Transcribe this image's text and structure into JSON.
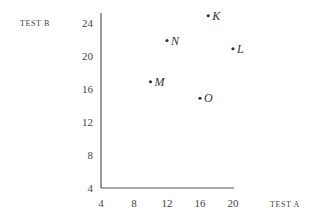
{
  "chart_data": {
    "type": "scatter",
    "title": "",
    "xlabel": "TEST A",
    "ylabel": "TEST B",
    "xlim": [
      4,
      20
    ],
    "ylim": [
      4,
      25
    ],
    "xticks": [
      4,
      8,
      12,
      16,
      20
    ],
    "yticks": [
      4,
      8,
      12,
      16,
      20,
      24
    ],
    "grid": false,
    "legend": null,
    "points": [
      {
        "label": "K",
        "x": 17,
        "y": 25
      },
      {
        "label": "N",
        "x": 12,
        "y": 22
      },
      {
        "label": "L",
        "x": 20,
        "y": 21
      },
      {
        "label": "M",
        "x": 10,
        "y": 17
      },
      {
        "label": "O",
        "x": 16,
        "y": 15
      }
    ]
  },
  "axis_color": "#555555",
  "point_color": "#333333"
}
